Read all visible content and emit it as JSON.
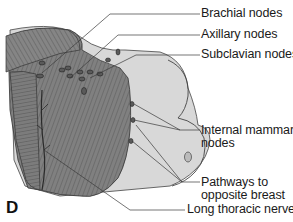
{
  "figure": {
    "panel_letter": "D",
    "colors": {
      "muscle": "#7f7f7f",
      "muscle_striation": "#555555",
      "skin": "#d6d6d6",
      "background": "#ffffff",
      "leader_line": "#3a3a3a"
    }
  },
  "labels": [
    {
      "id": "brachial",
      "lines": [
        "Brachial nodes"
      ]
    },
    {
      "id": "axillary",
      "lines": [
        "Axillary nodes"
      ]
    },
    {
      "id": "subclavian",
      "lines": [
        "Subclavian nodes"
      ]
    },
    {
      "id": "internal-mammary",
      "lines": [
        "Internal mammary",
        "nodes"
      ]
    },
    {
      "id": "pathways",
      "lines": [
        "Pathways to",
        "opposite breast"
      ]
    },
    {
      "id": "long-thoracic",
      "lines": [
        "Long thoracic nerve"
      ]
    }
  ]
}
